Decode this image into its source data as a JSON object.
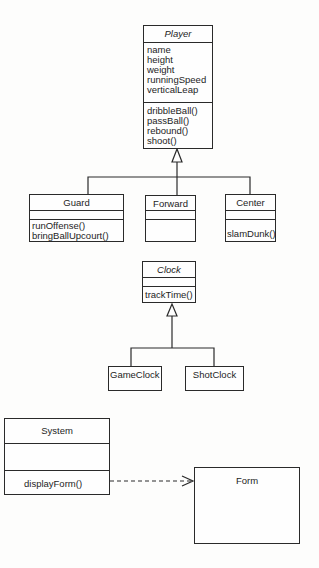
{
  "diagram": {
    "type": "UML class diagram",
    "classes": {
      "player": {
        "name": "Player",
        "abstract": true,
        "attributes": [
          "name",
          "height",
          "weight",
          "runningSpeed",
          "verticalLeap"
        ],
        "methods": [
          "dribbleBall()",
          "passBall()",
          "rebound()",
          "shoot()"
        ]
      },
      "guard": {
        "name": "Guard",
        "attributes": [],
        "methods": [
          "runOffense()",
          "bringBallUpcourt()"
        ]
      },
      "forward": {
        "name": "Forward",
        "attributes": [],
        "methods": []
      },
      "center": {
        "name": "Center",
        "attributes": [],
        "methods": [
          "slamDunk()"
        ]
      },
      "clock": {
        "name": "Clock",
        "abstract": true,
        "attributes": [],
        "methods": [
          "trackTime()"
        ]
      },
      "gameclock": {
        "name": "GameClock"
      },
      "shotclock": {
        "name": "ShotClock"
      },
      "system": {
        "name": "System",
        "attributes": [],
        "methods": [
          "displayForm()"
        ]
      },
      "form": {
        "name": "Form"
      }
    },
    "relationships": [
      {
        "type": "generalization",
        "from": "Guard",
        "to": "Player"
      },
      {
        "type": "generalization",
        "from": "Forward",
        "to": "Player"
      },
      {
        "type": "generalization",
        "from": "Center",
        "to": "Player"
      },
      {
        "type": "generalization",
        "from": "GameClock",
        "to": "Clock"
      },
      {
        "type": "generalization",
        "from": "ShotClock",
        "to": "Clock"
      },
      {
        "type": "dependency",
        "from": "System",
        "to": "Form"
      }
    ],
    "colors": {
      "line": "#2a2a2a",
      "background": "#fdfdfc",
      "text": "#1d1d1d"
    }
  }
}
